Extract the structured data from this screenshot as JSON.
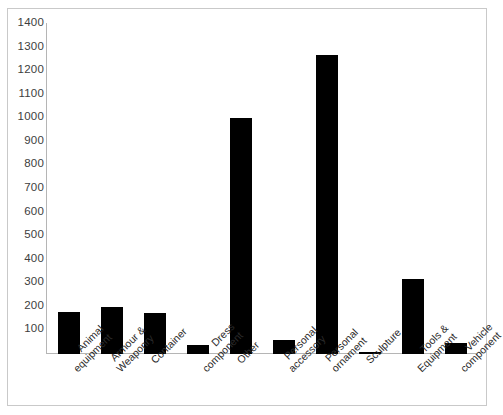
{
  "chart_data": {
    "type": "bar",
    "title": "",
    "subtitle": "",
    "xlabel": "",
    "ylabel": "",
    "ylim": [
      0,
      1400
    ],
    "grid": false,
    "legend": "none",
    "bar_color": "#000000",
    "axis_color": "#b5b5b5",
    "frame_color": "#c9c9c9",
    "label_rotation_deg": -45,
    "ytick_values": [
      100,
      200,
      300,
      400,
      500,
      600,
      700,
      800,
      900,
      1000,
      1100,
      1200,
      1300,
      1400
    ],
    "ytick_labels": [
      "100",
      "200",
      "300",
      "400",
      "500",
      "600",
      "700",
      "800",
      "900",
      "1000",
      "1100",
      "1200",
      "1300",
      "1400"
    ],
    "categories": [
      "Animal equipment",
      "Armour & Weaponry",
      "Container",
      "Dress component",
      "Other",
      "Personal accessory",
      "Personal ornament",
      "Sculpture",
      "Tools & Equipment",
      "Vehicle component"
    ],
    "category_lines": [
      [
        "Animal",
        "equipment"
      ],
      [
        "Armour &",
        "Weaponry"
      ],
      [
        "Container"
      ],
      [
        "Dress",
        "component"
      ],
      [
        "Other"
      ],
      [
        "Personal",
        "accessory"
      ],
      [
        "Personal",
        "ornament"
      ],
      [
        "Sculpture"
      ],
      [
        "Tools &",
        "Equipment"
      ],
      [
        "Vehicle",
        "component"
      ]
    ],
    "values": [
      180,
      200,
      175,
      40,
      1000,
      60,
      1270,
      10,
      320,
      45
    ]
  }
}
